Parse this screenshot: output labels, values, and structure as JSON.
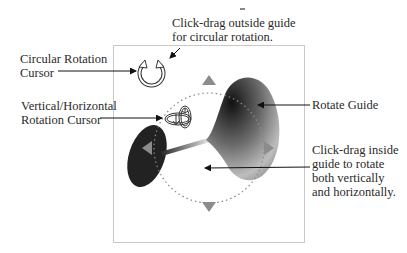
{
  "annotations": {
    "circular_drag": {
      "lines": [
        "Click-drag outside guide",
        "for circular rotation."
      ]
    },
    "circular_cursor": {
      "lines": [
        "Circular Rotation",
        "Cursor"
      ]
    },
    "vh_cursor": {
      "lines": [
        "Vertical/Horizontal",
        "Rotation Cursor"
      ]
    },
    "rotate_guide": {
      "lines": [
        "Rotate Guide"
      ]
    },
    "inside_drag": {
      "lines": [
        "Click-drag inside",
        "guide to rotate",
        "both vertically",
        "and horizontally."
      ]
    }
  },
  "icons": {
    "circular_rotation_cursor": "circular-arrows-icon",
    "vh_rotation_cursor": "orbit-arrows-icon",
    "guide_handles": [
      "triangle-up-icon",
      "triangle-down-icon",
      "triangle-left-icon",
      "triangle-right-icon"
    ]
  },
  "colors": {
    "frame": "#c8c8c8",
    "guide_dots": "#8a8a8a",
    "handle": "#8c8c8c",
    "shape_dark": "#1a1a1a",
    "shape_light": "#d8d8d8",
    "text": "#2a2a2a"
  }
}
